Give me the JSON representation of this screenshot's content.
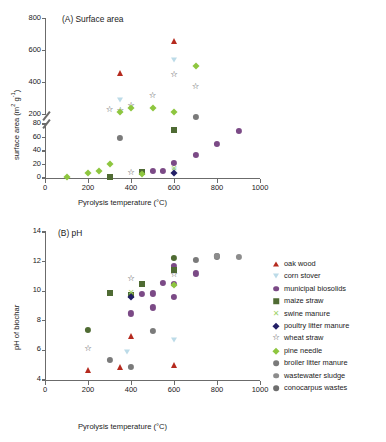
{
  "figure": {
    "background": "#ffffff",
    "colors": {
      "axis": "#6b6b6b",
      "text": "#1a1a1a",
      "oak_wood": "#b52a1e",
      "corn_stover": "#bcdbe8",
      "municipal_biosolids": "#7b4a86",
      "maize_straw": "#4f6b33",
      "swine_manure": "#9fd36a",
      "poultry_litter_manure": "#231f66",
      "wheat_straw": "#4a4a4a",
      "pine_needle": "#8ec63f",
      "broiler_litter_manure": "#7a7a7a",
      "wastewater_sludge": "#8c8c8c",
      "conocarpus_wastes": "#6e6e6e"
    }
  },
  "legend": {
    "position": "right-middle",
    "items": [
      {
        "label": "oak wood",
        "marker": "triangle-up",
        "color": "#b52a1e",
        "key": "oak_wood"
      },
      {
        "label": "corn stover",
        "marker": "triangle-down",
        "color": "#bcdbe8",
        "key": "corn_stover"
      },
      {
        "label": "municipal biosolids",
        "marker": "circle",
        "color": "#7b4a86",
        "key": "municipal_biosolids"
      },
      {
        "label": "maize straw",
        "marker": "square",
        "color": "#4f6b33",
        "key": "maize_straw"
      },
      {
        "label": "swine manure",
        "marker": "x",
        "color": "#9fd36a",
        "key": "swine_manure"
      },
      {
        "label": "poultry litter manure",
        "marker": "diamond",
        "color": "#231f66",
        "key": "poultry_litter_manure"
      },
      {
        "label": "wheat straw",
        "marker": "star-open",
        "color": "#4a4a4a",
        "key": "wheat_straw"
      },
      {
        "label": "pine needle",
        "marker": "diamond",
        "color": "#8ec63f",
        "key": "pine_needle"
      },
      {
        "label": "broiler litter manure",
        "marker": "circle",
        "color": "#7a7a7a",
        "key": "broiler_litter_manure"
      },
      {
        "label": "wastewater sludge",
        "marker": "circle",
        "color": "#8c8c8c",
        "key": "wastewater_sludge"
      },
      {
        "label": "conocarpus wastes",
        "marker": "circle",
        "color": "#6e6e6e",
        "key": "conocarpus_wastes"
      }
    ]
  },
  "chart_data": [
    {
      "id": "panel-a",
      "type": "scatter",
      "title": "(A) Surface area",
      "xlabel": "Pyrolysis temperature (°C)",
      "ylabel": "surface area (m² g⁻¹)",
      "xlim": [
        0,
        1000
      ],
      "xticks": [
        0,
        200,
        400,
        600,
        800,
        1000
      ],
      "xticklabels": [
        "0",
        "200",
        "400",
        "600",
        "800",
        "1000"
      ],
      "broken_axis": true,
      "ylim_lower": [
        0,
        80
      ],
      "yticks_lower": [
        0,
        20,
        40,
        60,
        80
      ],
      "ylim_upper": [
        200,
        800
      ],
      "yticks_upper": [
        200,
        400,
        600,
        800
      ],
      "grid": false,
      "series": [
        {
          "name": "oak wood",
          "key": "oak_wood",
          "marker": "triangle-up",
          "color": "#b52a1e",
          "points": [
            [
              350,
              455
            ],
            [
              600,
              655
            ]
          ]
        },
        {
          "name": "corn stover",
          "key": "corn_stover",
          "marker": "triangle-down",
          "color": "#bcdbe8",
          "points": [
            [
              350,
              290
            ],
            [
              600,
              535
            ],
            [
              600,
              12
            ]
          ]
        },
        {
          "name": "municipal biosolids",
          "key": "municipal_biosolids",
          "marker": "circle",
          "color": "#7b4a86",
          "points": [
            [
              450,
              9
            ],
            [
              500,
              10
            ],
            [
              550,
              10
            ],
            [
              600,
              22
            ],
            [
              700,
              34
            ],
            [
              800,
              50
            ],
            [
              900,
              70
            ]
          ]
        },
        {
          "name": "maize straw",
          "key": "maize_straw",
          "marker": "square",
          "color": "#4f6b33",
          "points": [
            [
              300,
              2
            ],
            [
              450,
              9
            ],
            [
              600,
              71
            ]
          ]
        },
        {
          "name": "swine manure",
          "key": "swine_manure",
          "marker": "x",
          "color": "#9fd36a",
          "points": [
            [
              600,
              13
            ]
          ]
        },
        {
          "name": "poultry litter manure",
          "key": "poultry_litter_manure",
          "marker": "diamond",
          "color": "#231f66",
          "points": [
            [
              600,
              8
            ]
          ]
        },
        {
          "name": "wheat straw",
          "key": "wheat_straw",
          "marker": "star-open",
          "color": "#4a4a4a",
          "points": [
            [
              300,
              228
            ],
            [
              350,
              218
            ],
            [
              400,
              253
            ],
            [
              400,
              7
            ],
            [
              500,
              312
            ],
            [
              600,
              443
            ],
            [
              700,
              370
            ]
          ]
        },
        {
          "name": "pine needle",
          "key": "pine_needle",
          "marker": "diamond",
          "color": "#8ec63f",
          "points": [
            [
              100,
              1
            ],
            [
              200,
              7
            ],
            [
              250,
              11
            ],
            [
              300,
              21
            ],
            [
              350,
              215
            ],
            [
              400,
              236
            ],
            [
              450,
              6
            ],
            [
              500,
              240
            ],
            [
              600,
              211
            ],
            [
              700,
              500
            ]
          ]
        },
        {
          "name": "broiler litter manure",
          "key": "broiler_litter_manure",
          "marker": "circle",
          "color": "#7a7a7a",
          "points": [
            [
              350,
              60
            ],
            [
              700,
              90
            ]
          ]
        },
        {
          "name": "wastewater sludge",
          "key": "wastewater_sludge",
          "marker": "circle",
          "color": "#8c8c8c",
          "points": []
        },
        {
          "name": "conocarpus wastes",
          "key": "conocarpus_wastes",
          "marker": "circle",
          "color": "#6e6e6e",
          "points": []
        }
      ]
    },
    {
      "id": "panel-b",
      "type": "scatter",
      "title": "(B) pH",
      "xlabel": "Pyrolysis temperature (°C)",
      "ylabel": "pH of biochar",
      "xlim": [
        0,
        1000
      ],
      "xticks": [
        0,
        200,
        400,
        600,
        800,
        1000
      ],
      "xticklabels": [
        "0",
        "200",
        "400",
        "600",
        "800",
        "1000"
      ],
      "ylim": [
        4,
        14
      ],
      "yticks": [
        4,
        6,
        8,
        10,
        12,
        14
      ],
      "grid": false,
      "series": [
        {
          "name": "oak wood",
          "key": "oak_wood",
          "marker": "triangle-up",
          "color": "#b52a1e",
          "points": [
            [
              200,
              4.65
            ],
            [
              350,
              4.9
            ],
            [
              400,
              6.95
            ],
            [
              600,
              5.0
            ]
          ]
        },
        {
          "name": "corn stover",
          "key": "corn_stover",
          "marker": "triangle-down",
          "color": "#bcdbe8",
          "points": [
            [
              380,
              5.9
            ],
            [
              600,
              6.7
            ]
          ]
        },
        {
          "name": "municipal biosolids",
          "key": "municipal_biosolids",
          "marker": "circle",
          "color": "#7b4a86",
          "points": [
            [
              400,
              8.5
            ],
            [
              450,
              9.8
            ],
            [
              500,
              9.85
            ],
            [
              500,
              8.9
            ],
            [
              550,
              10.55
            ],
            [
              600,
              11.7
            ],
            [
              600,
              9.6
            ],
            [
              600,
              10.5
            ],
            [
              700,
              11.2
            ]
          ]
        },
        {
          "name": "maize straw",
          "key": "maize_straw",
          "marker": "square",
          "color": "#4f6b33",
          "points": [
            [
              300,
              9.9
            ],
            [
              400,
              9.75
            ],
            [
              450,
              10.5
            ],
            [
              600,
              11.45
            ]
          ]
        },
        {
          "name": "swine manure",
          "key": "swine_manure",
          "marker": "x",
          "color": "#9fd36a",
          "points": [
            [
              400,
              9.9
            ]
          ]
        },
        {
          "name": "poultry litter manure",
          "key": "poultry_litter_manure",
          "marker": "diamond",
          "color": "#231f66",
          "points": [
            [
              400,
              9.6
            ]
          ]
        },
        {
          "name": "wheat straw",
          "key": "wheat_straw",
          "marker": "star-open",
          "color": "#4a4a4a",
          "points": [
            [
              200,
              6.1
            ],
            [
              400,
              10.85
            ],
            [
              600,
              11.1
            ]
          ]
        },
        {
          "name": "pine needle",
          "key": "pine_needle",
          "marker": "diamond",
          "color": "#8ec63f",
          "points": [
            [
              600,
              10.45
            ]
          ]
        },
        {
          "name": "broiler litter manure",
          "key": "broiler_litter_manure",
          "marker": "circle",
          "color": "#7a7a7a",
          "points": [
            [
              300,
              5.35
            ],
            [
              400,
              4.9
            ],
            [
              500,
              7.3
            ],
            [
              700,
              12.1
            ],
            [
              800,
              12.35
            ]
          ]
        },
        {
          "name": "wastewater sludge",
          "key": "wastewater_sludge",
          "marker": "circle",
          "color": "#8c8c8c",
          "points": [
            [
              800,
              12.4
            ],
            [
              900,
              12.3
            ]
          ]
        },
        {
          "name": "conocarpus wastes",
          "key": "conocarpus_wastes",
          "marker": "circle",
          "color": "#4f6b33",
          "points": [
            [
              200,
              7.4
            ],
            [
              600,
              12.25
            ]
          ]
        }
      ]
    }
  ]
}
